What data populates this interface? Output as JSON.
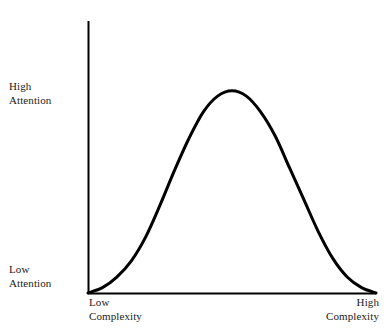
{
  "chart_data": {
    "type": "line",
    "title": "",
    "subtitle": "",
    "xlabel": "Complexity",
    "ylabel": "Attention",
    "grid": false,
    "legend": null,
    "axis_style": "two-axis-no-ticks",
    "xlim": [
      0,
      1
    ],
    "ylim": [
      0,
      1
    ],
    "x_tick_labels": [
      "Low Complexity",
      "High Complexity"
    ],
    "y_tick_labels": [
      "Low Attention",
      "High Attention"
    ],
    "annotations": [],
    "series": [
      {
        "name": "Attention vs Complexity",
        "color": "#000000",
        "line_width": 3,
        "x": [
          0.0,
          0.05,
          0.1,
          0.15,
          0.2,
          0.25,
          0.3,
          0.35,
          0.4,
          0.45,
          0.5,
          0.55,
          0.6,
          0.65,
          0.7,
          0.75,
          0.8,
          0.85,
          0.9,
          0.95,
          1.0
        ],
        "y": [
          0.0,
          0.02,
          0.06,
          0.12,
          0.21,
          0.33,
          0.46,
          0.58,
          0.68,
          0.74,
          0.76,
          0.74,
          0.68,
          0.59,
          0.47,
          0.35,
          0.23,
          0.13,
          0.06,
          0.02,
          0.0
        ]
      }
    ]
  },
  "axes": {
    "y_high_line1": "High",
    "y_high_line2": "Attention",
    "y_low_line1": "Low",
    "y_low_line2": "Attention",
    "x_low_line1": "Low",
    "x_low_line2": "Complexity",
    "x_high_line1": "High",
    "x_high_line2": "Complexity"
  },
  "colors": {
    "background": "#ffffff",
    "axis": "#000000",
    "curve": "#000000",
    "text": "#1a1a1a"
  }
}
